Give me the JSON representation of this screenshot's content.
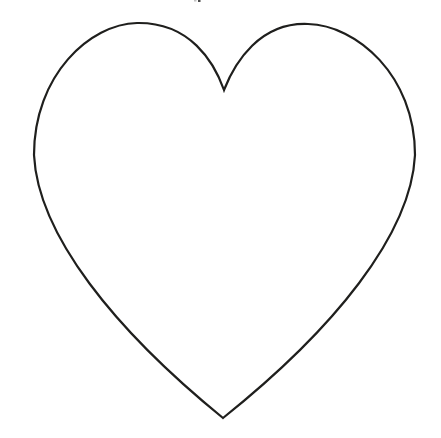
{
  "canvas": {
    "width": 441,
    "height": 438,
    "background": "#ffffff",
    "viewbox": "0 0 441 438"
  },
  "heart": {
    "description": "plain black line-art outline of a heart shape on a white background",
    "stroke_color": "#1f1f1d",
    "stroke_width": "2.2",
    "fill": "none",
    "path": "M 223 418 C 115 330 38 235 34 155 C 34 75 90 24 137 23 C 190 22 214 62 224 90 C 235 62 260 22 308 24 C 356 25 415 75 415 155 C 411 235 333 330 223 418 Z"
  },
  "artifact": {
    "description": "tiny cropped gray marks at the very top edge of the screenshot",
    "marks": [
      {
        "x": "194",
        "y": "0",
        "w": "2.5",
        "h": "1.5",
        "color": "#c2c2c2"
      },
      {
        "x": "198",
        "y": "0",
        "w": "2.5",
        "h": "2",
        "color": "#4d4d4d"
      }
    ]
  }
}
